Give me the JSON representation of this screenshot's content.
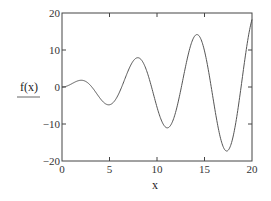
{
  "chart_data": {
    "type": "line",
    "title": "",
    "xlabel": "x",
    "ylabel": "f(x)",
    "xlim": [
      0,
      20
    ],
    "ylim": [
      -20,
      20
    ],
    "x_ticks": [
      "0",
      "5",
      "10",
      "15",
      "20"
    ],
    "y_ticks": [
      "20",
      "10",
      "0",
      "-10",
      "-20"
    ],
    "grid": false,
    "series": [
      {
        "name": "f(x)",
        "function_estimate": "x*sin(x)",
        "x": [
          0,
          2,
          4.91,
          7.98,
          11.09,
          14.21,
          17.34,
          20
        ],
        "values": [
          0,
          1.8,
          -4.8,
          7.9,
          -11.0,
          14.2,
          -17.3,
          18.3
        ]
      }
    ],
    "colors": {
      "line": "#555555",
      "axes": "#444444"
    }
  }
}
